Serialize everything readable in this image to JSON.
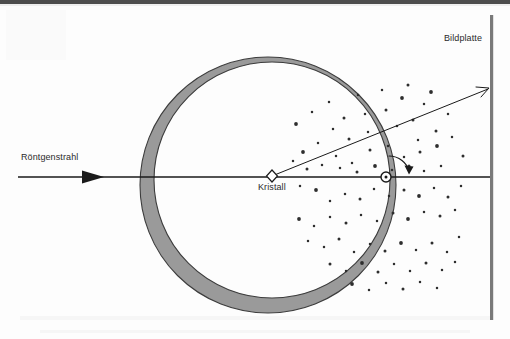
{
  "figure": {
    "background_color": "#fdfdfd",
    "top_band_color": "#4d4d4d",
    "line_color": "#1a1a1a",
    "ring_fill_color": "#9a9a9a",
    "ring_stroke_color": "#3c3c3c",
    "plate_color": "#7a7a7a",
    "dot_color": "#2e2e2e"
  },
  "labels": {
    "incident_beam": "Röntgenstrahl",
    "image_plate": "Bildplatte",
    "crystal": "Kristall"
  },
  "icons": {
    "incident_arrowhead": "triangle-arrowhead-right",
    "crystal_marker": "diamond-outline",
    "reflection_marker": "circle-dot",
    "rotation_arrow": "curved-arrow-clockwise",
    "diffracted_arrowhead": "line-arrowhead"
  },
  "geometry": {
    "outer_circle": {
      "cx": 268,
      "cy": 185,
      "r": 128
    },
    "inner_circle": {
      "cx": 272,
      "cy": 180,
      "r": 118
    },
    "crystal_point": {
      "x": 272,
      "y": 176
    },
    "reflection_point": {
      "x": 386,
      "y": 177
    },
    "beam_axis_y": 177,
    "beam_start_x": 18,
    "plate_x": 491,
    "plate_top_y": 15,
    "plate_bottom_y": 320,
    "diffracted_end": {
      "x": 489,
      "y": 88
    }
  },
  "chart_data": {
    "type": "scatter",
    "xlabel": "",
    "ylabel": "",
    "points": [
      [
        296,
        124
      ],
      [
        312,
        112
      ],
      [
        329,
        102
      ],
      [
        344,
        118
      ],
      [
        358,
        95
      ],
      [
        368,
        132
      ],
      [
        386,
        110
      ],
      [
        402,
        98
      ],
      [
        397,
        126
      ],
      [
        413,
        120
      ],
      [
        424,
        104
      ],
      [
        418,
        140
      ],
      [
        436,
        131
      ],
      [
        448,
        114
      ],
      [
        431,
        92
      ],
      [
        408,
        85
      ],
      [
        382,
        90
      ],
      [
        365,
        114
      ],
      [
        349,
        139
      ],
      [
        333,
        129
      ],
      [
        318,
        143
      ],
      [
        303,
        152
      ],
      [
        336,
        156
      ],
      [
        352,
        163
      ],
      [
        370,
        150
      ],
      [
        388,
        146
      ],
      [
        404,
        157
      ],
      [
        420,
        152
      ],
      [
        437,
        146
      ],
      [
        452,
        137
      ],
      [
        463,
        156
      ],
      [
        441,
        166
      ],
      [
        424,
        171
      ],
      [
        409,
        166
      ],
      [
        392,
        170
      ],
      [
        375,
        166
      ],
      [
        357,
        172
      ],
      [
        340,
        168
      ],
      [
        322,
        165
      ],
      [
        307,
        169
      ],
      [
        293,
        161
      ],
      [
        300,
        186
      ],
      [
        316,
        190
      ],
      [
        330,
        201
      ],
      [
        345,
        194
      ],
      [
        360,
        199
      ],
      [
        374,
        189
      ],
      [
        389,
        196
      ],
      [
        404,
        190
      ],
      [
        419,
        196
      ],
      [
        434,
        188
      ],
      [
        448,
        197
      ],
      [
        461,
        186
      ],
      [
        455,
        210
      ],
      [
        440,
        216
      ],
      [
        424,
        212
      ],
      [
        408,
        219
      ],
      [
        393,
        213
      ],
      [
        377,
        221
      ],
      [
        361,
        215
      ],
      [
        346,
        223
      ],
      [
        330,
        217
      ],
      [
        314,
        226
      ],
      [
        299,
        219
      ],
      [
        308,
        241
      ],
      [
        324,
        247
      ],
      [
        339,
        239
      ],
      [
        354,
        252
      ],
      [
        370,
        244
      ],
      [
        385,
        251
      ],
      [
        401,
        243
      ],
      [
        416,
        250
      ],
      [
        432,
        243
      ],
      [
        447,
        252
      ],
      [
        459,
        237
      ],
      [
        330,
        264
      ],
      [
        346,
        271
      ],
      [
        362,
        263
      ],
      [
        378,
        272
      ],
      [
        394,
        264
      ],
      [
        410,
        271
      ],
      [
        426,
        263
      ],
      [
        442,
        270
      ],
      [
        455,
        262
      ],
      [
        352,
        284
      ],
      [
        369,
        290
      ],
      [
        386,
        283
      ],
      [
        403,
        289
      ],
      [
        420,
        282
      ],
      [
        437,
        288
      ]
    ]
  }
}
